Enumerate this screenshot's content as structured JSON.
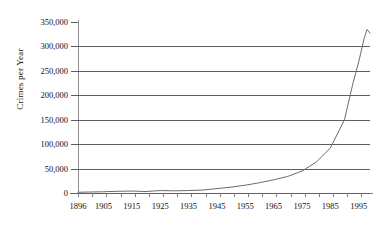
{
  "chart_data": {
    "type": "line",
    "title": "",
    "subtitle": "",
    "xlabel": "",
    "ylabel": "Crimes per Year",
    "xlim": [
      1896,
      1999
    ],
    "ylim": [
      0,
      350000
    ],
    "grid": true,
    "legend": null,
    "legend_position": "none",
    "y_ticks": [
      0,
      50000,
      100000,
      150000,
      200000,
      250000,
      300000,
      350000
    ],
    "y_tick_labels": [
      "0",
      "50,000",
      "100,000",
      "150,000",
      "200,000",
      "250,000",
      "300,000",
      "350,000"
    ],
    "x_ticks": [
      1896,
      1905,
      1915,
      1925,
      1935,
      1945,
      1955,
      1965,
      1975,
      1985,
      1995
    ],
    "x_tick_labels": [
      "1896",
      "1905",
      "1915",
      "1925",
      "1935",
      "1945",
      "1955",
      "1965",
      "1975",
      "1985",
      "1995"
    ],
    "x_minor_tick_step": 5,
    "series": [
      {
        "name": "Crimes per Year",
        "color": "#6b6b6b",
        "x": [
          1896,
          1900,
          1905,
          1910,
          1915,
          1920,
          1925,
          1930,
          1935,
          1940,
          1945,
          1950,
          1955,
          1960,
          1965,
          1970,
          1975,
          1980,
          1985,
          1990,
          1993,
          1995,
          1997,
          1998,
          1999
        ],
        "values": [
          1500,
          2000,
          2500,
          3500,
          4000,
          3000,
          5000,
          4500,
          5000,
          6000,
          9000,
          12000,
          16000,
          21000,
          27000,
          34000,
          45000,
          63000,
          92000,
          150000,
          225000,
          268000,
          318000,
          335000,
          327000
        ]
      }
    ]
  },
  "axes": {
    "y_title": "Crimes per Year"
  }
}
